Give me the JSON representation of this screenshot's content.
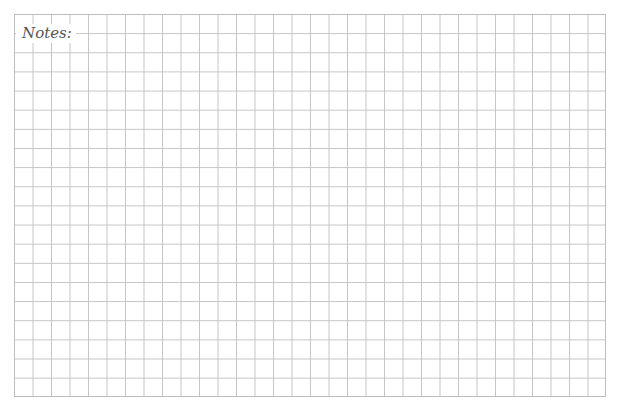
{
  "notes": {
    "label": "Notes:"
  },
  "grid": {
    "columns": 32,
    "rows": 20,
    "line_color": "#c4c4c4",
    "border_color": "#bdbdbd",
    "background_color": "#ffffff"
  }
}
